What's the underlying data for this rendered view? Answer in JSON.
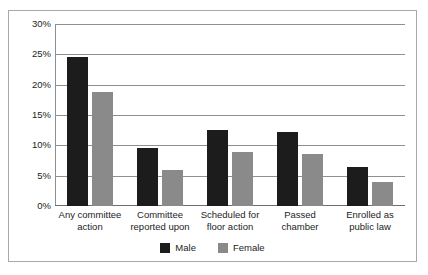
{
  "chart_data": {
    "type": "bar",
    "title": "",
    "xlabel": "",
    "ylabel": "",
    "ylim": [
      0,
      30
    ],
    "ytick_labels": [
      "30%",
      "25%",
      "20%",
      "15%",
      "10%",
      "5%",
      "0%"
    ],
    "ytick_values": [
      30,
      25,
      20,
      15,
      10,
      5,
      0
    ],
    "grid": true,
    "legend_position": "bottom-center",
    "categories": [
      "Any committee action",
      "Committee reported upon",
      "Scheduled for floor action",
      "Passed chamber",
      "Enrolled as public law"
    ],
    "category_lines": [
      [
        "Any committee",
        "action"
      ],
      [
        "Committee",
        "reported upon"
      ],
      [
        "Scheduled for",
        "floor action"
      ],
      [
        "Passed",
        "chamber"
      ],
      [
        "Enrolled as",
        "public law"
      ]
    ],
    "series": [
      {
        "name": "Male",
        "color": "#1c1c1c",
        "values": [
          24.6,
          9.6,
          12.6,
          12.2,
          6.4
        ]
      },
      {
        "name": "Female",
        "color": "#8a8a8a",
        "values": [
          18.8,
          5.9,
          8.9,
          8.6,
          4.0
        ]
      }
    ]
  },
  "legend": {
    "items": [
      {
        "label": "Male",
        "color": "#1c1c1c"
      },
      {
        "label": "Female",
        "color": "#8a8a8a"
      }
    ]
  }
}
